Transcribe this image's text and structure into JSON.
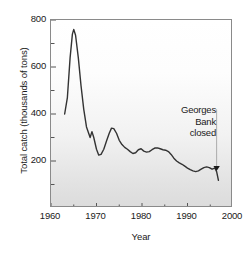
{
  "chart_data": {
    "type": "line",
    "title": "",
    "xlabel": "Year",
    "ylabel": "Total catch (thousands of tons)",
    "xlim": [
      1960,
      2000
    ],
    "ylim": [
      0,
      800
    ],
    "grid": false,
    "legend": null,
    "x_ticks": [
      "1960",
      "1970",
      "1980",
      "1990",
      "2000"
    ],
    "x_tick_values": [
      1960,
      1970,
      1980,
      1990,
      2000
    ],
    "x_minor_tick_values": [
      1965,
      1975,
      1985,
      1995
    ],
    "y_ticks": [
      "200",
      "400",
      "600",
      "800"
    ],
    "y_tick_values": [
      200,
      400,
      600,
      800
    ],
    "y_minor_tick_values": [
      100,
      300,
      500,
      700
    ],
    "series": [
      {
        "name": "Total catch",
        "color": "#333333",
        "x": [
          1963,
          1963.6,
          1964.2,
          1964.7,
          1965.0,
          1965.4,
          1966.0,
          1966.6,
          1967.2,
          1967.8,
          1968.2,
          1968.6,
          1969.0,
          1969.4,
          1970.0,
          1970.5,
          1971.0,
          1971.6,
          1972.2,
          1972.8,
          1973.3,
          1973.8,
          1974.4,
          1975.0,
          1975.6,
          1976.2,
          1976.8,
          1977.4,
          1978.0,
          1978.6,
          1979.2,
          1979.8,
          1980.4,
          1981.0,
          1981.6,
          1982.2,
          1982.8,
          1983.4,
          1984.0,
          1984.6,
          1985.2,
          1985.8,
          1986.4,
          1987.0,
          1987.6,
          1988.2,
          1988.8,
          1989.4,
          1990.0,
          1990.6,
          1991.2,
          1991.8,
          1992.4,
          1993.0,
          1993.6,
          1994.2,
          1994.8,
          1995.4,
          1996.0,
          1996.4,
          1996.8
        ],
        "y": [
          400,
          470,
          640,
          740,
          760,
          735,
          640,
          520,
          420,
          345,
          322,
          300,
          325,
          300,
          250,
          225,
          228,
          250,
          285,
          318,
          340,
          338,
          318,
          288,
          270,
          258,
          250,
          240,
          232,
          235,
          248,
          252,
          242,
          238,
          240,
          248,
          255,
          256,
          252,
          248,
          246,
          240,
          228,
          212,
          200,
          192,
          186,
          178,
          170,
          163,
          158,
          155,
          158,
          165,
          172,
          175,
          172,
          165,
          170,
          155,
          118
        ]
      }
    ],
    "annotations": [
      {
        "name": "georges-bank-closed",
        "lines": [
          "Georges",
          "Bank",
          "closed"
        ],
        "marker": "down-triangle",
        "marker_x": 1996.4,
        "marker_y": 155
      }
    ]
  },
  "axis": {
    "x_label": "Year",
    "y_label": "Total catch (thousands of tons)"
  },
  "annotation": {
    "line1": "Georges",
    "line2": "Bank",
    "line3": "closed"
  },
  "x_tick_labels": {
    "t0": "1960",
    "t1": "1970",
    "t2": "1980",
    "t3": "1990",
    "t4": "2000"
  },
  "y_tick_labels": {
    "t0": "200",
    "t1": "400",
    "t2": "600",
    "t3": "800"
  },
  "colors": {
    "line": "#333333",
    "frame": "#8a8a8a",
    "text": "#1a1a1a"
  }
}
